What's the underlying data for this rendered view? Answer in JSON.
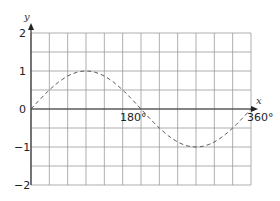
{
  "chart_data": {
    "type": "line",
    "title": "",
    "xlabel": "x",
    "ylabel": "y",
    "xlim": [
      0,
      360
    ],
    "ylim": [
      -2,
      2
    ],
    "grid": true,
    "x_tick_labels": [
      "180°",
      "360°"
    ],
    "y_tick_labels": [
      "2",
      "1",
      "0",
      "−1",
      "−2"
    ],
    "series": [
      {
        "name": "y = sin x",
        "style": "dashed",
        "x": [
          0,
          30,
          60,
          90,
          120,
          150,
          180,
          210,
          240,
          270,
          300,
          330,
          360
        ],
        "values": [
          0,
          0.5,
          0.87,
          1,
          0.87,
          0.5,
          0,
          -0.5,
          -0.87,
          -1,
          -0.87,
          -0.5,
          0
        ]
      }
    ]
  },
  "labels": {
    "x_axis": "x",
    "y_axis": "y",
    "y2": "2",
    "y1": "1",
    "y0": "0",
    "ym1": "−1",
    "ym2": "−2",
    "x180": "180°",
    "x360": "360°"
  }
}
